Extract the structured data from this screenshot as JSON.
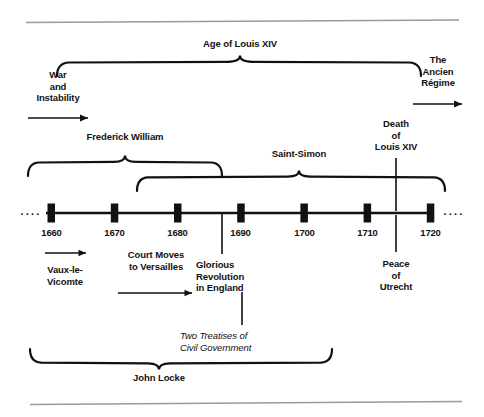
{
  "figure": {
    "kind": "historical-timeline",
    "axis": {
      "start_year": 1655,
      "end_year": 1725,
      "tick_years": [
        1660,
        1670,
        1680,
        1690,
        1700,
        1710,
        1720
      ],
      "tick_labels": [
        "1660",
        "1670",
        "1680",
        "1690",
        "1700",
        "1710",
        "1720"
      ],
      "leading_ellipsis": "....",
      "trailing_ellipsis": "...."
    },
    "spans_above": [
      {
        "label": "Age of Louis XIV",
        "start_year": 1660,
        "end_year": 1715,
        "row": 1
      },
      {
        "label": "Frederick William",
        "start_year": 1655,
        "end_year": 1686,
        "row": 2
      },
      {
        "label": "Saint-Simon",
        "start_year": 1673,
        "end_year": 1722,
        "row": 3
      }
    ],
    "spans_below": [
      {
        "label": "John Locke",
        "start_year": 1660,
        "end_year": 1704
      }
    ],
    "side_notes": [
      {
        "label": "War\nand\nInstability",
        "arrow": "left-to-right",
        "arrow_position": "below",
        "side": "left"
      },
      {
        "label": "The\nAncien\nRégime",
        "arrow": "left-to-right",
        "arrow_position": "below",
        "side": "right"
      }
    ],
    "events_above": [
      {
        "label": "Death\nof\nLouis XIV",
        "year": 1715
      }
    ],
    "events_below": [
      {
        "label": "Vaux-le-\nVicomte",
        "year": 1661,
        "arrow": "left-to-right",
        "arrow_position": "above"
      },
      {
        "label": "Court Moves\nto Versailles",
        "year": 1682,
        "arrow": "left-to-right",
        "arrow_position": "below"
      },
      {
        "label": "Glorious\nRevolution\nin England",
        "year": 1688
      },
      {
        "label": "Two Treatises of\nCivil Government",
        "year": 1690,
        "style": "italic"
      },
      {
        "label": "Peace\nof\nUtrecht",
        "year": 1713
      }
    ],
    "labels": {
      "age_of_louis_xiv": "Age of Louis XIV",
      "frederick_william": "Frederick William",
      "saint_simon": "Saint-Simon",
      "john_locke": "John Locke",
      "war_line1": "War",
      "war_line2": "and",
      "war_line3": "Instability",
      "ancien_line1": "The",
      "ancien_line2": "Ancien",
      "ancien_line3": "Régime",
      "death_line1": "Death",
      "death_line2": "of",
      "death_line3": "Louis XIV",
      "vaux_line1": "Vaux-le-",
      "vaux_line2": "Vicomte",
      "court_line1": "Court Moves",
      "court_line2": "to Versailles",
      "glorious_line1": "Glorious",
      "glorious_line2": "Revolution",
      "glorious_line3": "in England",
      "treatises_line1": "Two Treatises of",
      "treatises_line2": "Civil Government",
      "peace_line1": "Peace",
      "peace_line2": "of",
      "peace_line3": "Utrecht",
      "year_1660": "1660",
      "year_1670": "1670",
      "year_1680": "1680",
      "year_1690": "1690",
      "year_1700": "1700",
      "year_1710": "1710",
      "year_1720": "1720",
      "ellipsis_left": "....",
      "ellipsis_right": "...."
    },
    "colors": {
      "ink": "#111111",
      "rule": "#9a9a9a",
      "background": "#ffffff"
    }
  }
}
